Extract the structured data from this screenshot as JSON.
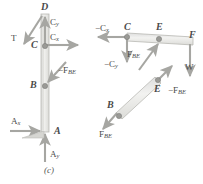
{
  "figure": {
    "caption": "(c)",
    "type": "free-body-diagram"
  },
  "left_member": {
    "name": "vertical-member-ACD",
    "points": [
      {
        "id": "D",
        "label": "D",
        "x": 44,
        "y": 8
      },
      {
        "id": "C",
        "label": "C",
        "x": 31,
        "y": 44
      },
      {
        "id": "B",
        "label": "B",
        "x": 31,
        "y": 85
      },
      {
        "id": "A",
        "label": "A",
        "x": 56,
        "y": 130
      }
    ],
    "forces": [
      {
        "id": "T",
        "label": "T",
        "sub": "",
        "sign": "",
        "x": 12,
        "y": 37
      },
      {
        "id": "Cy",
        "label": "C",
        "sub": "y",
        "sign": "",
        "x": 49,
        "y": 22
      },
      {
        "id": "Cx",
        "label": "C",
        "sub": "x",
        "sign": "",
        "x": 49,
        "y": 44
      },
      {
        "id": "-FBE",
        "label": "F",
        "sub": "BE",
        "sign": "−",
        "x": 58,
        "y": 72
      },
      {
        "id": "Ax",
        "label": "A",
        "sub": "x",
        "sign": "",
        "x": 12,
        "y": 119
      },
      {
        "id": "Ay",
        "label": "A",
        "sub": "y",
        "sign": "",
        "x": 59,
        "y": 155
      }
    ]
  },
  "right_member": {
    "name": "horizontal-member-CEF",
    "points": [
      {
        "id": "C",
        "label": "C",
        "x": 127,
        "y": 24
      },
      {
        "id": "E",
        "label": "E",
        "x": 158,
        "y": 24
      },
      {
        "id": "F",
        "label": "F",
        "x": 190,
        "y": 33
      }
    ],
    "forces": [
      {
        "id": "-Cx",
        "label": "C",
        "sub": "x",
        "sign": "−",
        "x": 97,
        "y": 28
      },
      {
        "id": "-Cy",
        "label": "C",
        "sub": "y",
        "sign": "−",
        "x": 106,
        "y": 62
      },
      {
        "id": "FBE",
        "label": "F",
        "sub": "BE",
        "sign": "",
        "x": 128,
        "y": 60
      },
      {
        "id": "W",
        "label": "W",
        "sub": "",
        "sign": "",
        "x": 188,
        "y": 70
      }
    ]
  },
  "diagonal_member": {
    "name": "diagonal-member-BE",
    "points": [
      {
        "id": "E",
        "label": "E",
        "x": 158,
        "y": 76
      },
      {
        "id": "B",
        "label": "B",
        "x": 112,
        "y": 105
      }
    ],
    "forces": [
      {
        "id": "-FBE",
        "label": "F",
        "sub": "BE",
        "sign": "−",
        "x": 170,
        "y": 85
      },
      {
        "id": "FBE",
        "label": "F",
        "sub": "BE",
        "sign": "",
        "x": 112,
        "y": 130
      }
    ]
  },
  "colors": {
    "member_fill": "#e8e8e6",
    "member_stroke": "#b9b9b4",
    "arrow": "#a6a6a2",
    "pin": "#8e8e8a",
    "text": "#4a4a4a"
  }
}
